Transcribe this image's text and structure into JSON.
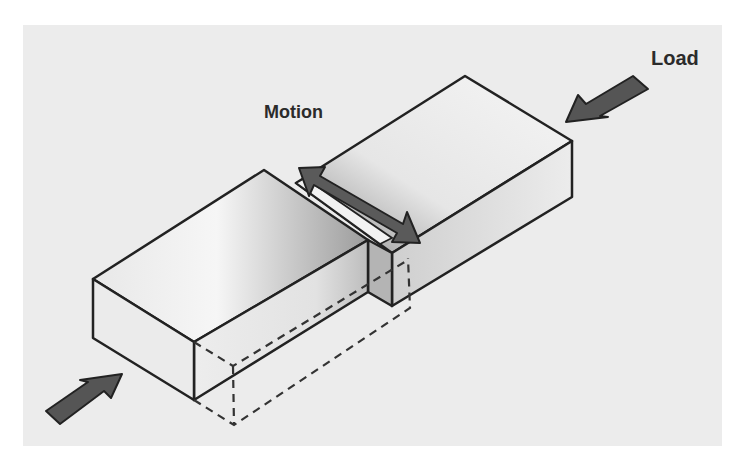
{
  "diagram": {
    "type": "fretting-wear-schematic",
    "labels": {
      "load": "Load",
      "motion": "Motion"
    },
    "elements": [
      {
        "name": "left-block",
        "description": "lower rectangular block, with dashed outline showing hidden/worn portion"
      },
      {
        "name": "right-block",
        "description": "upper rectangular block overlapping the left block"
      },
      {
        "name": "load-arrow-right",
        "description": "arrow pushing right block toward left (Load)"
      },
      {
        "name": "load-arrow-left",
        "description": "arrow pushing left block toward right"
      },
      {
        "name": "motion-arrow",
        "description": "double-headed arrow indicating oscillating motion at the contact"
      }
    ],
    "colors": {
      "background": "#ffffff",
      "panel": "#ececec",
      "outline": "#222222",
      "arrow_fill": "#5a5a5a",
      "block_light": "#f4f4f4",
      "block_dark": "#a8a8a8"
    }
  }
}
